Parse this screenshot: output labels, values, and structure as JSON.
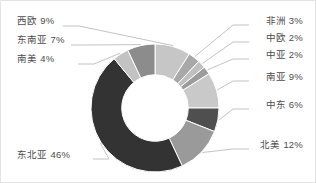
{
  "chart_data": {
    "type": "pie",
    "variant": "donut",
    "title": "",
    "xlabel": "",
    "ylabel": "",
    "legend_position": "callout-labels",
    "grid": false,
    "units": "percent",
    "total": 100,
    "start_angle_deg": 0,
    "direction": "clockwise",
    "inner_radius_ratio": 0.52,
    "categories": [
      "西欧",
      "非洲",
      "中欧",
      "中亚",
      "南亚",
      "中东",
      "北美",
      "东北亚",
      "南美",
      "东南亚"
    ],
    "values": [
      9,
      3,
      2,
      2,
      9,
      6,
      12,
      46,
      4,
      7
    ],
    "colors": [
      "#c6c6c6",
      "#a8a8a8",
      "#bfbfbf",
      "#9c9c9c",
      "#c9c9c9",
      "#4f4f4f",
      "#9a9a9a",
      "#333333",
      "#c2c2c2",
      "#8c8c8c"
    ],
    "slices": [
      {
        "label": "西欧",
        "value": 9,
        "display": "西欧 9%",
        "color": "#c6c6c6",
        "side": "left"
      },
      {
        "label": "非洲",
        "value": 3,
        "display": "非洲 3%",
        "color": "#a8a8a8",
        "side": "right"
      },
      {
        "label": "中欧",
        "value": 2,
        "display": "中欧 2%",
        "color": "#bfbfbf",
        "side": "right"
      },
      {
        "label": "中亚",
        "value": 2,
        "display": "中亚 2%",
        "color": "#9c9c9c",
        "side": "right"
      },
      {
        "label": "南亚",
        "value": 9,
        "display": "南亚 9%",
        "color": "#c9c9c9",
        "side": "right"
      },
      {
        "label": "中东",
        "value": 6,
        "display": "中东 6%",
        "color": "#4f4f4f",
        "side": "right"
      },
      {
        "label": "北美",
        "value": 12,
        "display": "北美 12%",
        "color": "#9a9a9a",
        "side": "right"
      },
      {
        "label": "东北亚",
        "value": 46,
        "display": "东北亚 46%",
        "color": "#333333",
        "side": "left"
      },
      {
        "label": "南美",
        "value": 4,
        "display": "南美 4%",
        "color": "#c2c2c2",
        "side": "left"
      },
      {
        "label": "东南亚",
        "value": 7,
        "display": "东南亚 7%",
        "color": "#8c8c8c",
        "side": "left"
      }
    ]
  },
  "labels": {
    "xiou": "西欧 9%",
    "dongnanya": "东南亚 7%",
    "nanmei": "南美 4%",
    "dongbeiya": "东北亚 46%",
    "feizhou": "非洲 3%",
    "zhongou": "中欧 2%",
    "zhongya": "中亚 2%",
    "nanya": "南亚 9%",
    "zhongdong": "中东 6%",
    "beimei": "北美 12%"
  },
  "style": {
    "label_color": "#4d4d4d",
    "leader_color": "#b4b4b4",
    "background": "#ffffff",
    "border_color": "#e3e3e3"
  }
}
